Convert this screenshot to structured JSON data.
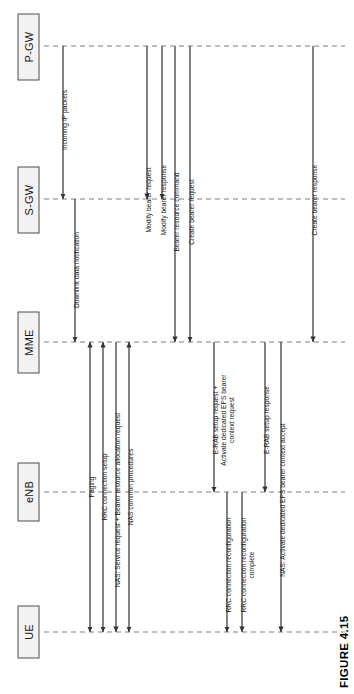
{
  "figure": {
    "caption": "FIGURE 4.15",
    "orientation": "rotated-90-ccw",
    "width": 354,
    "height": 694,
    "colors": {
      "background": "#ffffff",
      "node_fill": "#f2f2f2",
      "node_stroke": "#4d4d4d",
      "lifeline": "#808080",
      "arrow": "#595959",
      "text": "#1a1a1a"
    }
  },
  "nodes": [
    {
      "id": "pgw",
      "label": "P-GW",
      "lifeline_y": 46,
      "box": {
        "x": 18,
        "y": 14,
        "w": 21,
        "h": 66
      }
    },
    {
      "id": "sgw",
      "label": "S-GW",
      "lifeline_y": 199,
      "box": {
        "x": 18,
        "y": 167,
        "w": 21,
        "h": 66
      }
    },
    {
      "id": "mme",
      "label": "MME",
      "lifeline_y": 342,
      "box": {
        "x": 18,
        "y": 312,
        "w": 21,
        "h": 61
      }
    },
    {
      "id": "enb",
      "label": "eNB",
      "lifeline_y": 492,
      "box": {
        "x": 18,
        "y": 463,
        "w": 21,
        "h": 58
      }
    },
    {
      "id": "ue",
      "label": "UE",
      "lifeline_y": 632,
      "box": {
        "x": 18,
        "y": 606,
        "w": 21,
        "h": 52
      }
    }
  ],
  "lifeline_span": {
    "x_start": 44,
    "x_end": 345
  },
  "messages": [
    {
      "index": 1,
      "label": "Incoming IP packets",
      "from": "pgw",
      "to": "sgw",
      "x": 63,
      "label_anchor_y": 120,
      "arrowhead": "end"
    },
    {
      "index": 2,
      "label": "Downlink data notification",
      "from": "sgw",
      "to": "mme",
      "x": 75,
      "label_anchor_y": 270,
      "arrowhead": "end"
    },
    {
      "index": 3,
      "label": "Paging",
      "from": "mme",
      "to": "ue",
      "x": 90,
      "label_anchor_y": 487,
      "arrowhead": "both"
    },
    {
      "index": 4,
      "label": "RRC connection setup",
      "from": "mme",
      "to": "ue",
      "x": 103,
      "label_anchor_y": 487,
      "arrowhead": "both"
    },
    {
      "index": 5,
      "label": "NAS: Service request + Bearer resource allocation request",
      "from": "ue",
      "to": "mme",
      "x": 116,
      "label_anchor_y": 500,
      "arrowhead": "start"
    },
    {
      "index": 6,
      "label": "NAS common procedures",
      "from": "mme",
      "to": "ue",
      "x": 129,
      "label_anchor_y": 487,
      "arrowhead": "both"
    },
    {
      "index": 7,
      "label": "Modify bearer request",
      "from": "sgw",
      "to": "pgw",
      "x": 147,
      "label_anchor_y": 200,
      "arrowhead": "start"
    },
    {
      "index": 8,
      "label": "Modify bearer response",
      "from": "pgw",
      "to": "sgw",
      "x": 162,
      "label_anchor_y": 200,
      "arrowhead": "end"
    },
    {
      "index": 9,
      "label": "Bearer resource command",
      "from": "mme",
      "to": "pgw",
      "x": 175,
      "label_anchor_y": 212,
      "arrowhead": "start"
    },
    {
      "index": 10,
      "label": "Create bearer request",
      "from": "pgw",
      "to": "mme",
      "x": 190,
      "label_anchor_y": 212,
      "arrowhead": "end"
    },
    {
      "index": 11,
      "label": "E-RAB setup request +",
      "label_line2": "Activate dedicated EPS bearer",
      "label_line3": "context request",
      "from": "mme",
      "to": "enb",
      "x": 214,
      "label_anchor_y": 420,
      "arrowhead": "end"
    },
    {
      "index": 12,
      "label": "RRC connection reconfiguration",
      "from": "enb",
      "to": "ue",
      "x": 227,
      "label_anchor_y": 565,
      "arrowhead": "end"
    },
    {
      "index": 13,
      "label": "RRC connection reconfiguration",
      "label_line2": "complete",
      "from": "ue",
      "to": "enb",
      "x": 242,
      "label_anchor_y": 565,
      "arrowhead": "start"
    },
    {
      "index": 14,
      "label": "E-RAB setup response",
      "from": "enb",
      "to": "mme",
      "x": 265,
      "label_anchor_y": 420,
      "arrowhead": "start"
    },
    {
      "index": 15,
      "label": "NAS: Activate dedicated EPS bearer context accept",
      "from": "ue",
      "to": "mme",
      "x": 281,
      "label_anchor_y": 500,
      "arrowhead": "start"
    },
    {
      "index": 16,
      "label": "Create bearer response",
      "from": "mme",
      "to": "pgw",
      "x": 313,
      "label_anchor_y": 200,
      "arrowhead": "start"
    }
  ]
}
